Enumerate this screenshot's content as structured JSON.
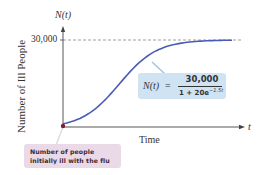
{
  "chart_data": {
    "type": "line",
    "title": "",
    "xlabel": "Time",
    "ylabel": "Number of Ill People",
    "x_axis_symbol": "t",
    "y_axis_symbol": "N(t)",
    "y_ticks": [
      "30,000"
    ],
    "asymptote": {
      "y": 30000,
      "style": "dashed",
      "color": "#777777"
    },
    "series": [
      {
        "name": "N(t) = 30,000 / (1 + 20e^(-1.5t))",
        "color": "#4a5bb5",
        "x": [
          0,
          0.5,
          1,
          1.5,
          2,
          2.5,
          3,
          3.5,
          4,
          4.5,
          5,
          5.5,
          6
        ],
        "values": [
          1429,
          2968,
          5474,
          9018,
          13412,
          18270,
          23086,
          25808,
          27753,
          28830,
          29375,
          29715,
          29869
        ]
      }
    ],
    "initial_point": {
      "x": 0,
      "y": 1429,
      "color": "#7a1f3d"
    },
    "ylim": [
      0,
      30000
    ],
    "grid": false,
    "legend": "none"
  },
  "labels": {
    "y_symbol": "N(t)",
    "x_symbol": "t",
    "y_tick": "30,000",
    "y_label": "Number of Ill People",
    "x_label": "Time"
  },
  "formula": {
    "lhs": "N(t)",
    "eq": "=",
    "numerator": "30,000",
    "denominator_base": "1 + 20e",
    "denominator_exp": "−1.5t"
  },
  "callout": {
    "line1": "Number of people",
    "line2": "initially ill with the flu"
  },
  "colors": {
    "curve": "#4a5bb5",
    "axes": "#444444",
    "formula_bg": "#cfe3f3",
    "callout_bg": "#ead9e6",
    "initial_point": "#7a1f3d"
  }
}
